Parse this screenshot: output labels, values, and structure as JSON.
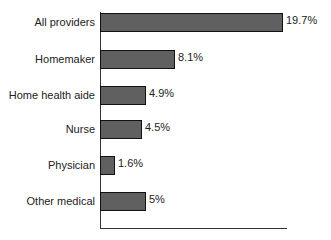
{
  "chart_data": {
    "type": "bar",
    "orientation": "horizontal",
    "title": "",
    "xlabel": "",
    "ylabel": "",
    "categories": [
      "All providers",
      "Homemaker",
      "Home health aide",
      "Nurse",
      "Physician",
      "Other medical"
    ],
    "values": [
      19.7,
      8.1,
      4.9,
      4.5,
      1.6,
      5.0
    ],
    "value_labels": [
      "19.7%",
      "8.1%",
      "4.9%",
      "4.5%",
      "1.6%",
      "5%"
    ],
    "xlim": [
      0,
      20
    ],
    "grid": false,
    "legend": null,
    "bar_color": "#606060"
  }
}
